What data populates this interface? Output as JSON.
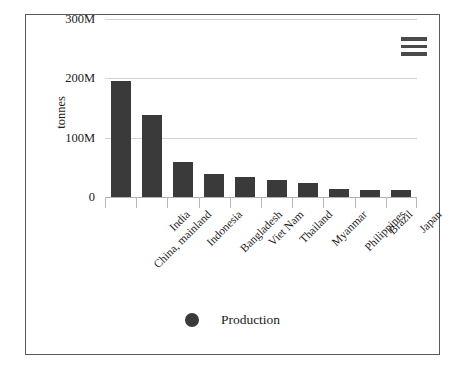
{
  "chart_data": {
    "type": "bar",
    "title": "",
    "xlabel": "",
    "ylabel": "tonnes",
    "ylim": [
      0,
      300000000
    ],
    "grid": true,
    "legend_position": "bottom-center",
    "categories": [
      "China, mainland",
      "India",
      "Indonesia",
      "Bangladesh",
      "Viet Nam",
      "Thailand",
      "Myanmar",
      "Philippines",
      "Brazil",
      "Japan"
    ],
    "series": [
      {
        "name": "Production",
        "color": "#3a3a3a",
        "values": [
          195000000,
          138000000,
          59000000,
          38000000,
          33000000,
          29000000,
          24000000,
          13000000,
          11000000,
          11000000
        ]
      }
    ],
    "y_ticks": [
      {
        "label": "300M",
        "value": 300000000
      },
      {
        "label": "200M",
        "value": 200000000
      },
      {
        "label": "100M",
        "value": 100000000
      },
      {
        "label": "0",
        "value": 0
      }
    ]
  },
  "legend": {
    "items": [
      {
        "label": "Production",
        "marker": "circle-marker",
        "color": "#3a3a3a"
      }
    ]
  },
  "toolbar": {
    "menu_icon": "hamburger-menu-icon"
  },
  "colors": {
    "bar": "#3a3a3a",
    "grid": "#d3d3d3",
    "axis": "#b0b0b0",
    "border": "#5a5a5a",
    "text": "#1c1c1c",
    "background": "#ffffff"
  }
}
